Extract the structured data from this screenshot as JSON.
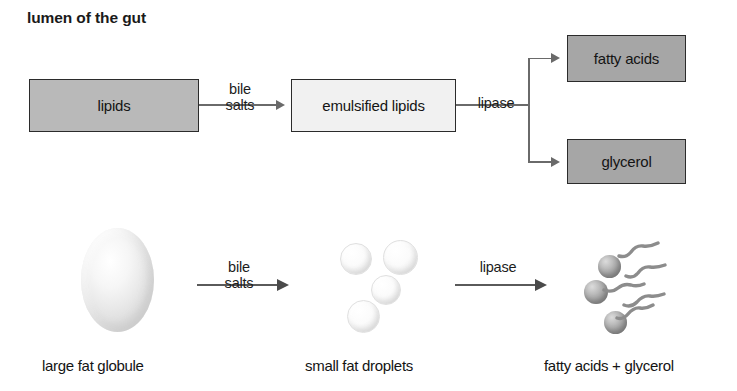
{
  "title": "lumen of the gut",
  "colors": {
    "box_mid_gray": "#b9b9b9",
    "box_light": "#f1f1f1",
    "box_dark_gray": "#a6a6a6",
    "box_border": "#2b2b2b",
    "arrow": "#6a6a6a",
    "arrow_bottom": "#5a5a5a",
    "text": "#141414",
    "background": "#ffffff",
    "sphere_gray": "#999999",
    "chain_gray": "#8c8c8c"
  },
  "flowchart": {
    "boxes": [
      {
        "id": "lipids",
        "label": "lipids",
        "fill": "mid-gray"
      },
      {
        "id": "emulsified",
        "label": "emulsified lipids",
        "fill": "light"
      },
      {
        "id": "fatty_acids",
        "label": "fatty acids",
        "fill": "dark-gray"
      },
      {
        "id": "glycerol",
        "label": "glycerol",
        "fill": "dark-gray"
      }
    ],
    "conditions": [
      {
        "id": "bile_salts_top",
        "line1": "bile",
        "line2": "salts"
      },
      {
        "id": "lipase_top",
        "line1": "lipase",
        "line2": ""
      }
    ]
  },
  "illustration": {
    "conditions": [
      {
        "id": "bile_salts_bottom",
        "line1": "bile",
        "line2": "salts"
      },
      {
        "id": "lipase_bottom",
        "line1": "lipase",
        "line2": ""
      }
    ],
    "captions": [
      {
        "id": "globule",
        "label": "large fat globule"
      },
      {
        "id": "droplets",
        "label": "small fat droplets"
      },
      {
        "id": "products",
        "label": "fatty acids + glycerol"
      }
    ],
    "counts": {
      "large_globules": 1,
      "small_droplets": 4,
      "glycerol_spheres": 3,
      "fatty_acid_chains": 5
    }
  }
}
